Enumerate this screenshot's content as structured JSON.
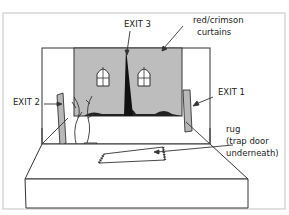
{
  "diagram": {
    "type": "stage-set-illustration",
    "labels": {
      "exit3": "EXIT 3",
      "curtains_line1": "red/crimson",
      "curtains_line2": "curtains",
      "exit2": "EXIT 2",
      "exit1": "EXIT 1",
      "rug_line1": "rug",
      "rug_line2": "(trap door",
      "rug_line3": "underneath)"
    },
    "colors": {
      "curtain": "#bdbdbd",
      "flat": "#b8b8b8",
      "outline": "#333333",
      "border": "#d8d8d8",
      "gap": "#111111"
    }
  }
}
